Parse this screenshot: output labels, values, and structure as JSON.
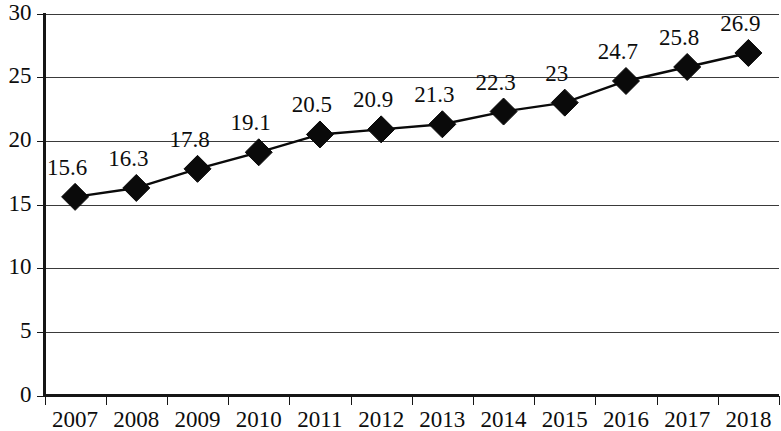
{
  "chart_data": {
    "type": "line",
    "title": "",
    "subtitle": "",
    "xlabel": "",
    "ylabel": "",
    "categories": [
      "2007",
      "2008",
      "2009",
      "2010",
      "2011",
      "2012",
      "2013",
      "2014",
      "2015",
      "2016",
      "2017",
      "2018"
    ],
    "values": [
      15.6,
      16.3,
      17.8,
      19.1,
      20.5,
      20.9,
      21.3,
      22.3,
      23,
      24.7,
      25.8,
      26.9
    ],
    "point_labels": [
      "15.6",
      "16.3",
      "17.8",
      "19.1",
      "20.5",
      "20.9",
      "21.3",
      "22.3",
      "23",
      "24.7",
      "25.8",
      "26.9"
    ],
    "series": [
      {
        "name": "",
        "values": [
          15.6,
          16.3,
          17.8,
          19.1,
          20.5,
          20.9,
          21.3,
          22.3,
          23,
          24.7,
          25.8,
          26.9
        ],
        "marker": "diamond",
        "color": "#0a0a0a"
      }
    ],
    "ylim": [
      0,
      30
    ],
    "ytick_values": [
      0,
      5,
      10,
      15,
      20,
      25,
      30
    ],
    "ytick_labels": [
      "0",
      "5",
      "10",
      "15",
      "20",
      "25",
      "30"
    ],
    "grid": true,
    "grid_axis": "y",
    "legend": false,
    "legend_position": "none",
    "data_labels_shown": true,
    "background_color": "#ffffff",
    "gridline_color": "#3a3a3a",
    "axis_color": "#161616"
  }
}
